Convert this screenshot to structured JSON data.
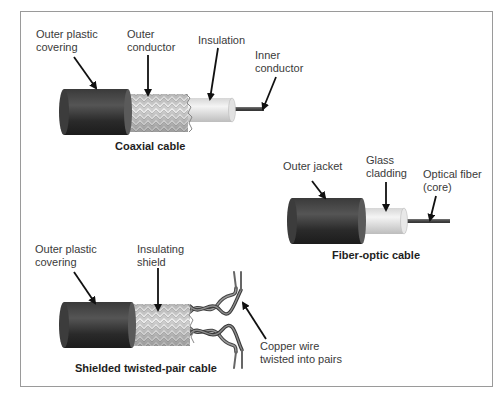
{
  "diagram": {
    "colors": {
      "jacket_dark": "#2e2e2e",
      "jacket_mid": "#4a4a4a",
      "braid_light": "#d9d9d9",
      "braid_dark": "#a8a8a8",
      "insulation": "#e6e6e6",
      "conductor": "#555555",
      "arrow": "#111111",
      "frame": "#9a9a9a",
      "label_text": "#3a3a3a"
    },
    "coaxial": {
      "caption": "Coaxial cable",
      "labels": {
        "outer_plastic": "Outer plastic\ncovering",
        "outer_conductor": "Outer\nconductor",
        "insulation": "Insulation",
        "inner_conductor": "Inner\nconductor"
      }
    },
    "fiber": {
      "caption": "Fiber-optic cable",
      "labels": {
        "outer_jacket": "Outer jacket",
        "glass_cladding": "Glass\ncladding",
        "optical_fiber": "Optical fiber\n(core)"
      }
    },
    "stp": {
      "caption": "Shielded twisted-pair cable",
      "labels": {
        "outer_plastic": "Outer plastic\ncovering",
        "insulating_shield": "Insulating\nshield",
        "copper_wire": "Copper wire\ntwisted into pairs"
      }
    }
  }
}
